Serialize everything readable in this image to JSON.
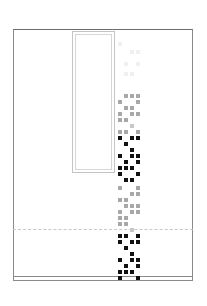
{
  "colors": {
    "frame": "#8a8a8a",
    "panel_border": "#c4c4c4",
    "dashed": "#c8c8c8",
    "faint": "#f0f0f0",
    "gray": "#a8a8a8",
    "light_gray": "#c8c8c8",
    "black": "#111111"
  },
  "grid": {
    "x0": 118,
    "pitch": 6,
    "cells": [
      {
        "col": 0,
        "row": 0,
        "y": 42,
        "shade": "faint"
      },
      {
        "col": 2,
        "row": 0,
        "y": 50,
        "shade": "faint"
      },
      {
        "col": 3,
        "row": 0,
        "y": 50,
        "shade": "faint"
      },
      {
        "col": 1,
        "row": 0,
        "y": 62,
        "shade": "faint"
      },
      {
        "col": 3,
        "row": 0,
        "y": 62,
        "shade": "faint"
      },
      {
        "col": 1,
        "row": 0,
        "y": 72,
        "shade": "faint"
      },
      {
        "col": 2,
        "row": 0,
        "y": 72,
        "shade": "faint"
      },
      {
        "col": 1,
        "y": 94,
        "shade": "gray"
      },
      {
        "col": 2,
        "y": 94,
        "shade": "gray"
      },
      {
        "col": 3,
        "y": 94,
        "shade": "gray"
      },
      {
        "col": 0,
        "y": 100,
        "shade": "gray"
      },
      {
        "col": 3,
        "y": 100,
        "shade": "gray"
      },
      {
        "col": 1,
        "y": 106,
        "shade": "gray"
      },
      {
        "col": 2,
        "y": 106,
        "shade": "gray"
      },
      {
        "col": 0,
        "y": 112,
        "shade": "gray"
      },
      {
        "col": 2,
        "y": 112,
        "shade": "gray"
      },
      {
        "col": 3,
        "y": 112,
        "shade": "gray"
      },
      {
        "col": 0,
        "y": 118,
        "shade": "gray"
      },
      {
        "col": 1,
        "y": 118,
        "shade": "gray"
      },
      {
        "col": 2,
        "y": 124,
        "shade": "light_gray"
      },
      {
        "col": 0,
        "y": 130,
        "shade": "gray"
      },
      {
        "col": 1,
        "y": 130,
        "shade": "gray"
      },
      {
        "col": 3,
        "y": 130,
        "shade": "gray"
      },
      {
        "col": 0,
        "y": 136,
        "shade": "black"
      },
      {
        "col": 2,
        "y": 136,
        "shade": "black"
      },
      {
        "col": 3,
        "y": 136,
        "shade": "black"
      },
      {
        "col": 1,
        "y": 142,
        "shade": "black"
      },
      {
        "col": 2,
        "y": 148,
        "shade": "black"
      },
      {
        "col": 0,
        "y": 154,
        "shade": "black"
      },
      {
        "col": 2,
        "y": 154,
        "shade": "black"
      },
      {
        "col": 3,
        "y": 154,
        "shade": "black"
      },
      {
        "col": 1,
        "y": 160,
        "shade": "black"
      },
      {
        "col": 3,
        "y": 160,
        "shade": "black"
      },
      {
        "col": 0,
        "y": 166,
        "shade": "black"
      },
      {
        "col": 1,
        "y": 166,
        "shade": "black"
      },
      {
        "col": 2,
        "y": 166,
        "shade": "black"
      },
      {
        "col": 0,
        "y": 172,
        "shade": "black"
      },
      {
        "col": 3,
        "y": 172,
        "shade": "black"
      },
      {
        "col": 1,
        "y": 178,
        "shade": "black"
      },
      {
        "col": 2,
        "y": 178,
        "shade": "black"
      },
      {
        "col": 0,
        "y": 186,
        "shade": "gray"
      },
      {
        "col": 3,
        "y": 186,
        "shade": "gray"
      },
      {
        "col": 2,
        "y": 192,
        "shade": "gray"
      },
      {
        "col": 3,
        "y": 192,
        "shade": "gray"
      },
      {
        "col": 0,
        "y": 198,
        "shade": "gray"
      },
      {
        "col": 1,
        "y": 198,
        "shade": "gray"
      },
      {
        "col": 1,
        "y": 204,
        "shade": "gray"
      },
      {
        "col": 2,
        "y": 204,
        "shade": "gray"
      },
      {
        "col": 3,
        "y": 204,
        "shade": "gray"
      },
      {
        "col": 0,
        "y": 210,
        "shade": "gray"
      },
      {
        "col": 2,
        "y": 210,
        "shade": "gray"
      },
      {
        "col": 3,
        "y": 210,
        "shade": "gray"
      },
      {
        "col": 0,
        "y": 216,
        "shade": "gray"
      },
      {
        "col": 1,
        "y": 216,
        "shade": "gray"
      },
      {
        "col": 0,
        "y": 222,
        "shade": "gray"
      },
      {
        "col": 1,
        "y": 222,
        "shade": "gray"
      },
      {
        "col": 2,
        "y": 228,
        "shade": "light_gray"
      },
      {
        "col": 0,
        "y": 234,
        "shade": "black"
      },
      {
        "col": 1,
        "y": 234,
        "shade": "black"
      },
      {
        "col": 3,
        "y": 234,
        "shade": "black"
      },
      {
        "col": 0,
        "y": 240,
        "shade": "black"
      },
      {
        "col": 2,
        "y": 240,
        "shade": "black"
      },
      {
        "col": 3,
        "y": 240,
        "shade": "black"
      },
      {
        "col": 1,
        "y": 246,
        "shade": "black"
      },
      {
        "col": 2,
        "y": 252,
        "shade": "black"
      },
      {
        "col": 0,
        "y": 258,
        "shade": "black"
      },
      {
        "col": 2,
        "y": 258,
        "shade": "black"
      },
      {
        "col": 3,
        "y": 258,
        "shade": "black"
      },
      {
        "col": 1,
        "y": 264,
        "shade": "black"
      },
      {
        "col": 3,
        "y": 264,
        "shade": "black"
      },
      {
        "col": 0,
        "y": 270,
        "shade": "black"
      },
      {
        "col": 1,
        "y": 270,
        "shade": "black"
      },
      {
        "col": 2,
        "y": 270,
        "shade": "black"
      },
      {
        "col": 0,
        "y": 276,
        "shade": "black"
      },
      {
        "col": 3,
        "y": 276,
        "shade": "black"
      }
    ]
  }
}
